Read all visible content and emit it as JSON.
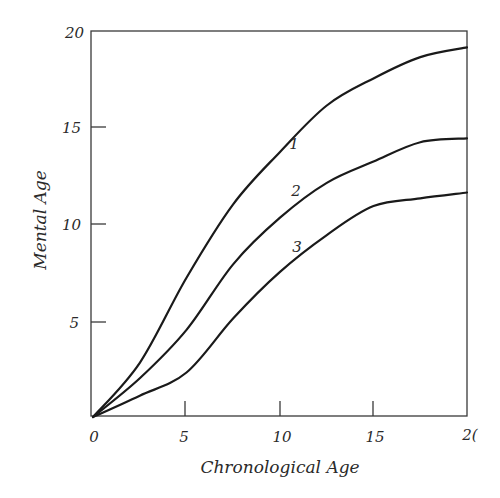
{
  "chart_data": {
    "type": "line",
    "title": "",
    "xlabel": "Chronological Age",
    "ylabel": "Mental Age",
    "xlim": [
      0,
      20
    ],
    "ylim": [
      0,
      20
    ],
    "grid": false,
    "legend": "none (curves labeled inline 1, 2, 3)",
    "x_ticks": [
      "0",
      "5",
      "10",
      "15",
      "20"
    ],
    "y_ticks": [
      "5",
      "10",
      "15",
      "20"
    ],
    "x": [
      0,
      2.5,
      5,
      7.5,
      10,
      12.5,
      15,
      17.5,
      20
    ],
    "series": [
      {
        "name": "1",
        "values": [
          0,
          2.8,
          7.2,
          11.0,
          13.7,
          16.1,
          17.5,
          18.6,
          19.1
        ]
      },
      {
        "name": "2",
        "values": [
          0,
          2.0,
          4.5,
          7.9,
          10.3,
          12.1,
          13.2,
          14.2,
          14.4
        ]
      },
      {
        "name": "3",
        "values": [
          0,
          1.1,
          2.3,
          5.1,
          7.5,
          9.4,
          10.9,
          11.3,
          11.6
        ]
      }
    ],
    "annotations": [
      {
        "text": "1",
        "x": 10.8,
        "y": 14.3
      },
      {
        "text": "2",
        "x": 10.9,
        "y": 11.8
      },
      {
        "text": "3",
        "x": 10.9,
        "y": 8.9
      }
    ]
  },
  "labels": {
    "x_axis_title": "Chronological Age",
    "y_axis_title": "Mental Age",
    "x_ticks": [
      "0",
      "5",
      "10",
      "15",
      "2("
    ],
    "y_ticks": [
      "5",
      "10",
      "15",
      "20"
    ],
    "curves": [
      "1",
      "2",
      "3"
    ]
  }
}
